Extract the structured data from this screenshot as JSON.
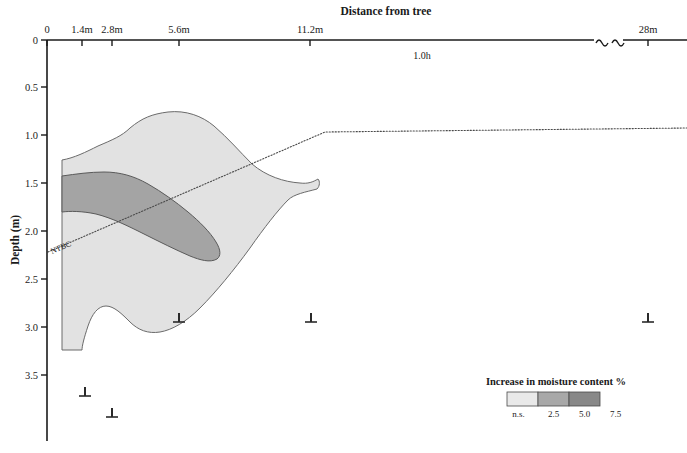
{
  "figure": {
    "x_axis": {
      "title": "Distance from tree",
      "tick_labels": [
        "0",
        "1.4m",
        "2.8m",
        "5.6m",
        "11.2m",
        "28m"
      ],
      "tick_values": [
        0,
        1.4,
        2.8,
        5.6,
        11.2,
        28
      ],
      "tick_pixels": [
        47,
        82,
        112,
        179,
        310,
        648
      ],
      "has_break": true,
      "break_pixels": [
        595,
        622
      ]
    },
    "y_axis": {
      "title": "Depth (m)",
      "tick_labels": [
        "0",
        "0.5",
        "1.0",
        "1.5",
        "2.0",
        "2.5",
        "3.0",
        "3.5"
      ],
      "tick_values": [
        0,
        0.5,
        1.0,
        1.5,
        2.0,
        2.5,
        3.0,
        3.5
      ],
      "tick_pixels": [
        40,
        87,
        135,
        183,
        231,
        279,
        327,
        375
      ]
    },
    "annotations": [
      {
        "name": "tree-height-note",
        "text": "1.0h",
        "x": 420,
        "y": 58
      },
      {
        "name": "ntbc-line-label",
        "text": "NTBC",
        "x": 52,
        "y": 252,
        "rotation": -23
      }
    ],
    "legend": {
      "title": "Increase in moisture content %",
      "tick_labels": [
        "n.s.",
        "2.5",
        "5.0",
        "7.5"
      ],
      "swatch_colors": [
        "#e9e9e9",
        "#a8a8a8",
        "#888888"
      ],
      "x": 507,
      "y": 392,
      "swatch_width": 31,
      "swatch_height": 14
    },
    "markers": {
      "name": "soil-probe-marker",
      "glyph": "⊥",
      "positions": [
        {
          "x": 85,
          "y": 396
        },
        {
          "x": 112,
          "y": 417
        },
        {
          "x": 179,
          "y": 322
        },
        {
          "x": 311,
          "y": 322
        },
        {
          "x": 648,
          "y": 322
        }
      ]
    }
  },
  "chart_data": {
    "type": "area",
    "title": "Distance from tree",
    "xlabel": "Distance from tree",
    "ylabel": "Depth (m)",
    "xlim": [
      0,
      28
    ],
    "ylim": [
      0,
      3.8
    ],
    "y_inverted": true,
    "grid": false,
    "legend_position": "bottom-right",
    "xticks": [
      0,
      1.4,
      2.8,
      5.6,
      11.2,
      28
    ],
    "xticklabels": [
      "0",
      "1.4m",
      "2.8m",
      "5.6m",
      "11.2m",
      "28m"
    ],
    "yticks": [
      0,
      0.5,
      1.0,
      1.5,
      2.0,
      2.5,
      3.0,
      3.5
    ],
    "yticklabels": [
      "0",
      "0.5",
      "1.0",
      "1.5",
      "2.0",
      "2.5",
      "3.0",
      "3.5"
    ],
    "legend_entries": [
      "n.s.",
      "2.5",
      "5.0",
      "7.5"
    ],
    "legend_title": "Increase in moisture content %",
    "series": [
      {
        "name": "2.5% moisture increase contour",
        "fill": "#e2e2e2",
        "stroke": "#6b6b6b",
        "path": "M 62,160 C 74,158 86,152 98,146 C 112,140 122,136 130,128 C 142,118 152,114 168,112 C 186,110 202,116 214,126 C 228,138 240,152 252,164 C 266,176 284,182 300,183 C 308,184 313,182 318,179 C 320,181 320,186 317,189 C 306,192 294,194 288,200 C 278,210 264,228 250,248 C 234,270 216,292 200,308 C 186,322 172,330 160,332 C 148,334 138,330 130,322 C 122,314 114,306 106,306 C 98,306 92,314 88,326 C 84,338 82,346 82,350 L 62,350 Z"
      },
      {
        "name": "5.0% moisture increase contour",
        "fill": "#a4a4a4",
        "stroke": "#5a5a5a",
        "path": "M 62,176 C 76,174 90,172 104,172 C 120,172 134,176 148,184 C 162,192 176,202 188,212 C 200,222 210,232 216,242 C 221,250 221,256 217,259 C 210,263 200,260 190,256 C 176,250 160,242 144,234 C 128,226 112,218 96,214 C 82,211 70,211 62,212 Z"
      }
    ],
    "reference_line": {
      "name": "NTBC reference line",
      "label": "NTBC",
      "style": "dotted",
      "points": [
        [
          48,
          252
        ],
        [
          325,
          132
        ],
        [
          687,
          128
        ]
      ]
    }
  }
}
